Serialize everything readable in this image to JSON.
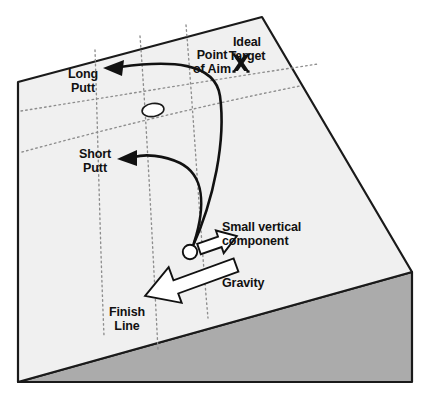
{
  "figure": {
    "type": "diagram",
    "background_color": "#ffffff"
  },
  "surface": {
    "top_face_color": "#f0f0f0",
    "front_face_color": "#ababab",
    "outline_color": "#1a1a1a",
    "grid_color": "#8a8a8a",
    "grid_style": "dotted"
  },
  "labels": {
    "long_putt": "Long\nPutt",
    "short_putt": "Short\nPutt",
    "point_of_aim": "Point\nof Aim",
    "ideal_target": "Ideal\nTarget",
    "small_vertical_component": "Small vertical\ncomponent",
    "gravity": "Gravity",
    "finish_line": "Finish\nLine"
  },
  "markers": {
    "ideal_target_glyph": "X",
    "hole": "golf-hole-ellipse",
    "ball": "golf-ball-circle"
  },
  "arrows": {
    "long_putt_path": {
      "name": "long-putt-curve",
      "color": "#111111",
      "direction": "curves-left-and-up-from-ball"
    },
    "short_putt_path": {
      "name": "short-putt-curve",
      "color": "#111111",
      "direction": "curves-left-from-ball"
    },
    "small_vertical_component": {
      "name": "small-vertical-component-arrow",
      "fill": "#ffffff",
      "stroke": "#111111",
      "direction": "right-and-slightly-up"
    },
    "gravity": {
      "name": "gravity-arrow",
      "fill": "#ffffff",
      "stroke": "#111111",
      "direction": "down-slope-to-lower-left"
    }
  },
  "label_positions": {
    "long_putt": {
      "x": 54,
      "y": 68
    },
    "short_putt": {
      "x": 66,
      "y": 148
    },
    "point_of_aim": {
      "x": 182,
      "y": 49
    },
    "ideal_target": {
      "x": 226,
      "y": 36
    },
    "small_vertical_component": {
      "x": 222,
      "y": 221
    },
    "gravity": {
      "x": 207,
      "y": 277
    },
    "finish_line": {
      "x": 99,
      "y": 306
    }
  }
}
